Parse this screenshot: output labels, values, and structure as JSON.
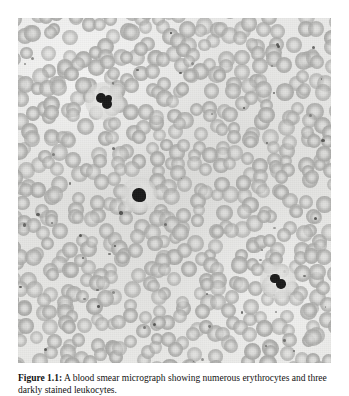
{
  "figure": {
    "caption_label": "Figure 1.1:",
    "caption_text": "A blood smear micrograph showing numerous erythrocytes and three darkly stained leukocytes.",
    "image_alt": "light-microscopy blood smear",
    "colors": {
      "background": "#e9e9e7",
      "erythrocyte": "#b0b0ae",
      "leukocyte_nucleus": "#1b1b1b",
      "platelet": "#4a4a48",
      "page": "#ffffff"
    },
    "plate": {
      "left": 18,
      "top": 18,
      "width": 313,
      "height": 345
    },
    "leukocytes": [
      {
        "name": "leukocyte-upper-left",
        "cx": 86,
        "cy": 83,
        "r": 13
      },
      {
        "name": "leukocyte-center",
        "cx": 121,
        "cy": 177,
        "r": 12
      },
      {
        "name": "leukocyte-lower-right",
        "cx": 260,
        "cy": 263,
        "r": 12
      }
    ],
    "counts": {
      "leukocytes": 3
    }
  }
}
